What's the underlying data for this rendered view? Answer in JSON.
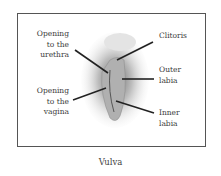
{
  "diagram": {
    "title": "Vulva",
    "labels": {
      "urethra": "Opening\nto the\nurethra",
      "vagina": "Opening\nto the\nvagina",
      "clitoris": "Clitoris",
      "outer_labia": "Outer\nlabia",
      "inner_labia": "Inner\nlabia"
    },
    "label_lines": {
      "urethra": [
        "Opening",
        "to the",
        "urethra"
      ],
      "vagina": [
        "Opening",
        "to the",
        "vagina"
      ],
      "clitoris": [
        "Clitoris"
      ],
      "outer_labia": [
        "Outer",
        "labia"
      ],
      "inner_labia": [
        "Inner",
        "labia"
      ]
    },
    "colors": {
      "frame": "#555555",
      "text": "#3b3b3b",
      "arrow": "#222222"
    }
  }
}
